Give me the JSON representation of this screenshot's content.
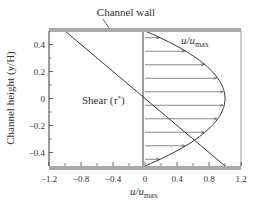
{
  "chart_data": {
    "type": "line",
    "title": "",
    "xlabel": "u/u_max",
    "xlabel_main": "u/u",
    "xlabel_sub": "max",
    "ylabel": "Channel height (y/H)",
    "xlim": [
      -1.2,
      1.2
    ],
    "ylim": [
      -0.5,
      0.5
    ],
    "x_ticks": [
      -1.2,
      -0.8,
      -0.4,
      0,
      0.4,
      0.8,
      1.2
    ],
    "x_tick_labels": [
      "−1.2",
      "−0.8",
      "−0.4",
      "0",
      "0.4",
      "0.8",
      "1.2"
    ],
    "y_ticks": [
      -0.4,
      -0.2,
      0,
      0.2,
      0.4
    ],
    "y_tick_labels": [
      "−0.4",
      "−0.2",
      "0",
      "0.2",
      "0.4"
    ],
    "grid": false,
    "series": [
      {
        "name": "u/u_max",
        "description": "Parabolic velocity profile u/u_max = 1 - 4(y/H)^2, hatched with horizontal arrows",
        "y": [
          -0.5,
          -0.4,
          -0.3,
          -0.2,
          -0.1,
          0,
          0.1,
          0.2,
          0.3,
          0.4,
          0.5
        ],
        "x": [
          0,
          0.36,
          0.64,
          0.84,
          0.96,
          1.0,
          0.96,
          0.84,
          0.64,
          0.36,
          0
        ]
      },
      {
        "name": "Shear (τ*)",
        "description": "Linear shear stress distribution τ* = -2(y/H)",
        "y": [
          -0.5,
          0.5
        ],
        "x": [
          1.0,
          -1.0
        ]
      }
    ],
    "annotations": [
      {
        "text": "Channel wall",
        "points_to": "top wall"
      },
      {
        "text": "u/u_max",
        "near": "velocity profile"
      },
      {
        "text": "Shear (τ*)",
        "near": "shear line"
      }
    ]
  },
  "labels": {
    "channel_wall": "Channel wall",
    "velocity_main": "u/u",
    "velocity_sub": "max",
    "shear": "Shear (τ*)",
    "shear_prefix": "Shear (",
    "shear_tau": "τ",
    "shear_star": "*",
    "shear_suffix": ")",
    "y_axis": "Channel height (y/H)",
    "x_axis_main": "u/u",
    "x_axis_sub": "max"
  },
  "colors": {
    "wall": "#a9a9a9",
    "line": "#3a3a3a",
    "frame": "#9a9a9a"
  }
}
